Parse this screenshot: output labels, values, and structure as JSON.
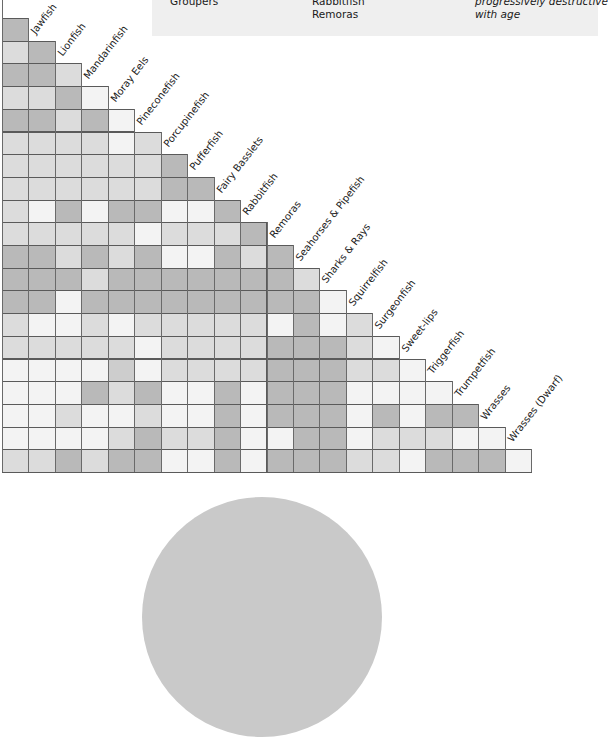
{
  "legend": {
    "items": [
      {
        "text": "Groupers",
        "x": 170,
        "y": -5,
        "italic": false
      },
      {
        "text": "Rabbitfish",
        "x": 312,
        "y": -5,
        "italic": false
      },
      {
        "text": "Remoras",
        "x": 312,
        "y": 8,
        "italic": false
      },
      {
        "text": "progressively destructive",
        "x": 475,
        "y": -5,
        "italic": true
      },
      {
        "text": "with age",
        "x": 475,
        "y": 8,
        "italic": true
      }
    ]
  },
  "colors": {
    "shade_0": "#f3f3f3",
    "shade_1": "#dcdcdc",
    "shade_2": "#cdcdcd",
    "shade_3": "#b9b9b9"
  },
  "chart_data": {
    "type": "heatmap",
    "title": "",
    "columns": [
      "",
      "Jawfish",
      "Lionfish",
      "Mandarinfish",
      "Moray Eels",
      "Pineconefish",
      "Porcupinefish",
      "Pufferfish",
      "Fairy Basslets",
      "Rabbitfish",
      "Remoras",
      "Seahorses & Pipefish",
      "Sharks & Rays",
      "Squirrelfish",
      "Surgeonfish",
      "Sweet-lips",
      "Triggerfish",
      "Trumpetfish",
      "Wrasses",
      "Wrasses (Dwarf)"
    ],
    "rows": [
      [
        3
      ],
      [
        1,
        3
      ],
      [
        3,
        3,
        1
      ],
      [
        1,
        1,
        3,
        0
      ],
      [
        3,
        3,
        1,
        3,
        0
      ],
      [
        1,
        1,
        1,
        1,
        0,
        1
      ],
      [
        1,
        1,
        1,
        1,
        1,
        1,
        3
      ],
      [
        1,
        1,
        1,
        1,
        1,
        1,
        3,
        3
      ],
      [
        1,
        0,
        3,
        0,
        3,
        3,
        0,
        0,
        3
      ],
      [
        1,
        1,
        1,
        1,
        1,
        0,
        1,
        1,
        1,
        3
      ],
      [
        3,
        3,
        1,
        3,
        1,
        3,
        0,
        0,
        3,
        1,
        3
      ],
      [
        3,
        3,
        3,
        1,
        3,
        3,
        3,
        3,
        3,
        3,
        3,
        1
      ],
      [
        3,
        3,
        0,
        3,
        3,
        3,
        3,
        3,
        3,
        3,
        3,
        3,
        0
      ],
      [
        1,
        0,
        0,
        1,
        0,
        1,
        1,
        1,
        1,
        1,
        0,
        3,
        0,
        1
      ],
      [
        1,
        1,
        1,
        1,
        1,
        0,
        1,
        1,
        1,
        1,
        3,
        3,
        3,
        1,
        0
      ],
      [
        0,
        0,
        0,
        0,
        2,
        0,
        1,
        1,
        1,
        1,
        3,
        3,
        3,
        1,
        1,
        0
      ],
      [
        0,
        0,
        0,
        3,
        1,
        3,
        0,
        0,
        3,
        0,
        3,
        3,
        3,
        0,
        0,
        0,
        0
      ],
      [
        0,
        0,
        1,
        0,
        0,
        1,
        0,
        0,
        3,
        0,
        3,
        3,
        3,
        0,
        3,
        0,
        3,
        3
      ],
      [
        0,
        0,
        0,
        0,
        1,
        3,
        1,
        1,
        3,
        0,
        0,
        3,
        3,
        0,
        1,
        1,
        1,
        0,
        0
      ],
      [
        1,
        1,
        3,
        1,
        3,
        3,
        0,
        0,
        3,
        0,
        3,
        3,
        3,
        1,
        1,
        0,
        3,
        3,
        3,
        0
      ]
    ],
    "legend_position": "top-right"
  },
  "layout": {
    "grid_left": 2,
    "grid_top": 18,
    "cell_w": 26.45,
    "cell_h": 22.7
  }
}
